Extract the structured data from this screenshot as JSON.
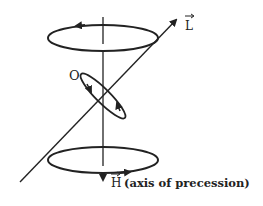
{
  "diagram": {
    "type": "physics-precession-diagram",
    "labels": {
      "origin": "O",
      "angular_momentum": "L",
      "field": "H",
      "field_note": "(axis of precession)"
    },
    "vectors": [
      {
        "name": "L",
        "description": "angular momentum vector, tilted",
        "arrow": true
      },
      {
        "name": "H",
        "description": "field vector, vertical axis of precession (pointing down)",
        "arrow": true
      }
    ],
    "circles": [
      {
        "name": "top-precession-orbit",
        "rotation_arrow": "leftward on far side"
      },
      {
        "name": "bottom-precession-orbit",
        "rotation_arrow": "rightward on near side"
      },
      {
        "name": "spin-orbit-around-origin",
        "rotation_arrows": 2
      }
    ],
    "colors": {
      "ink": "#222222",
      "background": "#ffffff"
    }
  }
}
